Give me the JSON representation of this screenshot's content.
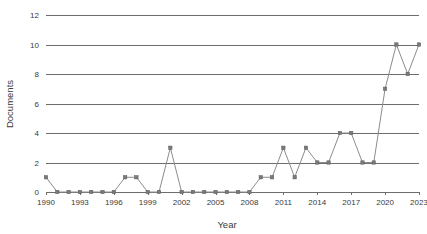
{
  "chart_data": {
    "type": "line",
    "title": "",
    "xlabel": "Year",
    "ylabel": "Documents",
    "xlim": [
      1990,
      2023
    ],
    "ylim": [
      0,
      12
    ],
    "yticks": [
      0,
      2,
      4,
      6,
      8,
      10,
      12
    ],
    "xticks": [
      1990,
      1993,
      1996,
      1999,
      2002,
      2005,
      2008,
      2011,
      2014,
      2017,
      2020,
      2023
    ],
    "grid": "horizontal",
    "legend": "none",
    "series": [
      {
        "name": "Documents",
        "color": "#8c8c8c",
        "marker": "square",
        "x": [
          1990,
          1991,
          1992,
          1993,
          1994,
          1995,
          1996,
          1997,
          1998,
          1999,
          2000,
          2001,
          2002,
          2003,
          2004,
          2005,
          2006,
          2007,
          2008,
          2009,
          2010,
          2011,
          2012,
          2013,
          2014,
          2015,
          2016,
          2017,
          2018,
          2019,
          2020,
          2021,
          2022,
          2023
        ],
        "values": [
          1,
          0,
          0,
          0,
          0,
          0,
          0,
          1,
          1,
          0,
          0,
          3,
          0,
          0,
          0,
          0,
          0,
          0,
          0,
          1,
          1,
          3,
          1,
          3,
          2,
          2,
          4,
          4,
          2,
          2,
          7,
          10,
          8,
          10
        ]
      }
    ]
  },
  "axis": {
    "x_title": "Year",
    "y_title": "Documents"
  }
}
